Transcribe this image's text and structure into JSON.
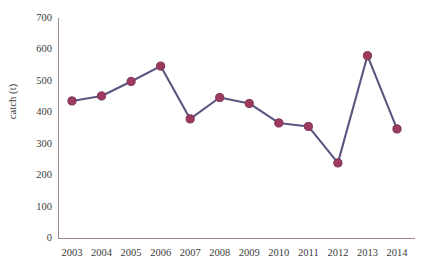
{
  "chart_data": {
    "type": "line",
    "title": "",
    "xlabel": "",
    "ylabel": "catch (t)",
    "categories": [
      "2003",
      "2004",
      "2005",
      "2006",
      "2007",
      "2008",
      "2009",
      "2010",
      "2011",
      "2012",
      "2013",
      "2014"
    ],
    "values": [
      436,
      452,
      498,
      547,
      379,
      447,
      428,
      366,
      355,
      239,
      580,
      347
    ],
    "series": [
      {
        "name": "catch",
        "values": [
          436,
          452,
          498,
          547,
          379,
          447,
          428,
          366,
          355,
          239,
          580,
          347
        ]
      }
    ],
    "ylim": [
      0,
      700
    ],
    "y_ticks": [
      "0",
      "100",
      "200",
      "300",
      "400",
      "500",
      "600",
      "700"
    ],
    "y_tick_values": [
      0,
      100,
      200,
      300,
      400,
      500,
      600,
      700
    ],
    "grid": false,
    "legend": "none",
    "line_color": "#5b5680",
    "marker_color": "#9e3a5f",
    "marker_edge_color": "#7b3556",
    "axis_color": "#a08a8a",
    "text_color": "#3b3b3b",
    "background_color": "#ffffff"
  }
}
